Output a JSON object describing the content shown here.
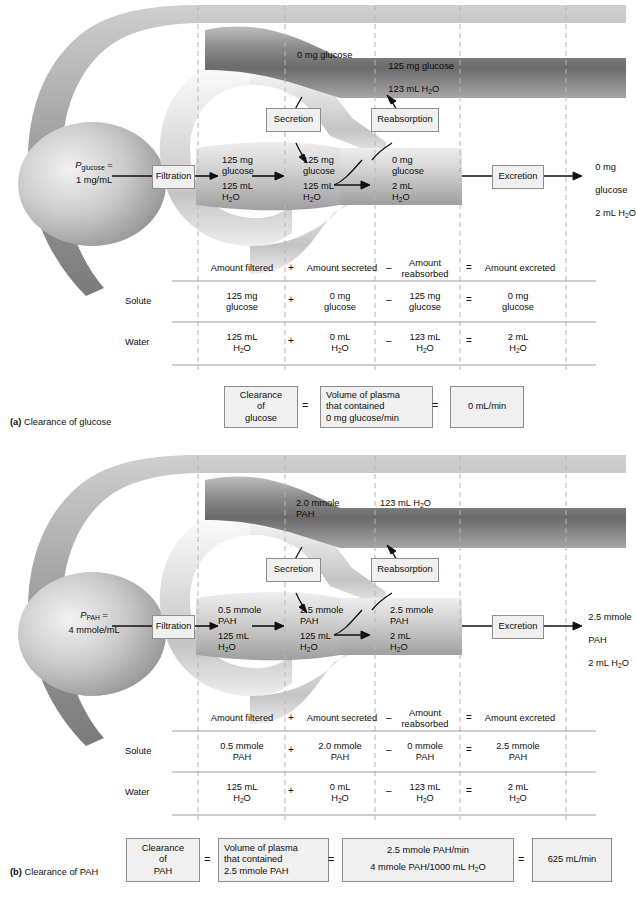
{
  "figure": {
    "panels": [
      {
        "id": "a",
        "caption_marker": "(a)",
        "caption_text": "Clearance of glucose",
        "plasma": {
          "symbol": "P",
          "subscript": "glucose",
          "eq": "=",
          "value": "1 mg/mL"
        },
        "process_boxes": {
          "filtration": "Filtration",
          "secretion": "Secretion",
          "reabsorption": "Reabsorption",
          "excretion": "Excretion"
        },
        "capillary_labels": {
          "secreted_into_blood": "0 mg glucose",
          "reabsorbed_into_blood_line1": "125 mg glucose",
          "reabsorbed_into_blood_line2": "123 mL H2O"
        },
        "tubule_labels": {
          "filtered_solute": "125 mg\nglucose",
          "filtered_water": "125 mL\nH2O",
          "post_secretion_solute": "125 mg\nglucose",
          "post_secretion_water": "125 mL\nH2O",
          "post_reabsorption_solute": "0 mg\nglucose",
          "post_reabsorption_water": "2 mL\nH2O"
        },
        "excreted_label": {
          "line1": "0 mg",
          "line2": "glucose",
          "line3": "2 mL H2O"
        },
        "table": {
          "headers": [
            "Amount filtered",
            "Amount secreted",
            "Amount\nreabsorbed",
            "Amount excreted"
          ],
          "operators": [
            "+",
            "–",
            "="
          ],
          "rows": [
            {
              "label": "Solute",
              "cells": [
                "125 mg\nglucose",
                "0 mg\nglucose",
                "125 mg\nglucose",
                "0 mg\nglucose"
              ],
              "ops": [
                "+",
                "–",
                "="
              ]
            },
            {
              "label": "Water",
              "cells": [
                "125 mL\nH2O",
                "0 mL\nH2O",
                "123 mL\nH2O",
                "2 mL\nH2O"
              ],
              "ops": [
                "+",
                "–",
                "="
              ]
            }
          ]
        },
        "clearance": {
          "term1": "Clearance\nof\nglucose",
          "op1": "=",
          "term2": "Volume of plasma\nthat contained\n0 mg glucose/min",
          "op2": "=",
          "result": "0 mL/min"
        }
      },
      {
        "id": "b",
        "caption_marker": "(b)",
        "caption_text": "Clearance of PAH",
        "plasma": {
          "symbol": "P",
          "subscript": "PAH",
          "eq": "=",
          "value": "4 mmole/mL"
        },
        "process_boxes": {
          "filtration": "Filtration",
          "secretion": "Secretion",
          "reabsorption": "Reabsorption",
          "excretion": "Excretion"
        },
        "capillary_labels": {
          "secreted_into_blood": "2.0 mmole\nPAH",
          "reabsorbed_into_blood_line1": "123 mL H2O",
          "reabsorbed_into_blood_line2": ""
        },
        "tubule_labels": {
          "filtered_solute": "0.5 mmole\nPAH",
          "filtered_water": "125 mL\nH2O",
          "post_secretion_solute": "2.5 mmole\nPAH",
          "post_secretion_water": "125 mL\nH2O",
          "post_reabsorption_solute": "2.5 mmole\nPAH",
          "post_reabsorption_water": "2 mL\nH2O"
        },
        "excreted_label": {
          "line1": "2.5 mmole",
          "line2": "PAH",
          "line3": "2 mL H2O"
        },
        "table": {
          "headers": [
            "Amount filtered",
            "Amount secreted",
            "Amount\nreabsorbed",
            "Amount excreted"
          ],
          "operators": [
            "+",
            "–",
            "="
          ],
          "rows": [
            {
              "label": "Solute",
              "cells": [
                "0.5 mmole\nPAH",
                "2.0 mmole\nPAH",
                "0 mmole\nPAH",
                "2.5 mmole\nPAH"
              ],
              "ops": [
                "+",
                "–",
                "="
              ]
            },
            {
              "label": "Water",
              "cells": [
                "125 mL\nH2O",
                "0 mL\nH2O",
                "123 mL\nH2O",
                "2 mL\nH2O"
              ],
              "ops": [
                "+",
                "–",
                "="
              ]
            }
          ]
        },
        "clearance": {
          "term1": "Clearance\nof\nPAH",
          "op1": "=",
          "term2": "Volume of plasma\nthat contained\n2.5 mmole PAH",
          "op2": "=",
          "term3_numerator": "2.5 mmole PAH/min",
          "term3_denominator": "4 mmole PAH/1000 mL H2O",
          "op3": "=",
          "result": "625 mL/min"
        }
      }
    ]
  },
  "colors": {
    "capillary_dark": "#6f6f6f",
    "tubule_light": "#d9d9d9",
    "box_fill": "#f0f0f0",
    "box_border": "#8d8d8d",
    "dash_line": "#b6b6b6",
    "rule_line": "#9c9c9c",
    "text": "#0d0d0d"
  }
}
